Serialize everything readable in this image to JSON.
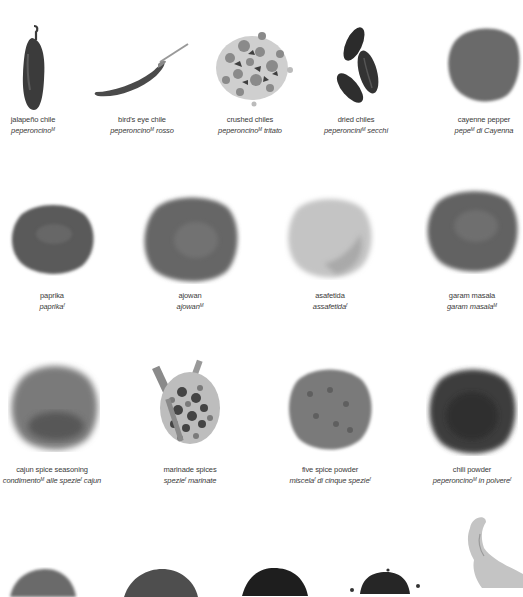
{
  "rows": [
    {
      "items": [
        {
          "id": "jalapeno",
          "en": "jalapeño chile",
          "it_parts": [
            {
              "t": "peperoncino",
              "g": "M"
            }
          ],
          "cx": 33,
          "label_y": 113,
          "art": "jalapeno-icon",
          "tone": "#3b3b3b"
        },
        {
          "id": "birds-eye",
          "en": "bird's eye chile",
          "it_parts": [
            {
              "t": "peperoncino",
              "g": "M"
            },
            {
              "t": " rosso"
            }
          ],
          "cx": 142,
          "label_y": 113,
          "art": "birds-eye-chile-icon",
          "tone": "#555555"
        },
        {
          "id": "crushed",
          "en": "crushed chiles",
          "it_parts": [
            {
              "t": "peperoncino",
              "g": "M"
            },
            {
              "t": " tritato"
            }
          ],
          "cx": 250,
          "label_y": 113,
          "art": "crushed-chiles-icon",
          "tone": "#8a8a8a"
        },
        {
          "id": "dried",
          "en": "dried chiles",
          "it_parts": [
            {
              "t": "peperoncini",
              "g": "M"
            },
            {
              "t": " secchi"
            }
          ],
          "cx": 356,
          "label_y": 113,
          "art": "dried-chiles-icon",
          "tone": "#2e2e2e"
        },
        {
          "id": "cayenne",
          "en": "cayenne pepper",
          "it_parts": [
            {
              "t": "pepe",
              "g": "M"
            },
            {
              "t": " di Cayenna"
            }
          ],
          "cx": 483,
          "label_y": 113,
          "art": "cayenne-powder-icon",
          "tone": "#6a6a6a"
        }
      ]
    },
    {
      "items": [
        {
          "id": "paprika",
          "en": "paprika",
          "it_parts": [
            {
              "t": "paprika",
              "g": "f"
            }
          ],
          "cx": 52,
          "label_y": 289,
          "art": "paprika-powder-icon",
          "tone": "#5e5e5e"
        },
        {
          "id": "ajowan",
          "en": "ajowan",
          "it_parts": [
            {
              "t": "ajowan",
              "g": "M"
            }
          ],
          "cx": 190,
          "label_y": 289,
          "art": "ajowan-powder-icon",
          "tone": "#6d6d6d"
        },
        {
          "id": "asafetida",
          "en": "asafetida",
          "it_parts": [
            {
              "t": "assafetida",
              "g": "f"
            }
          ],
          "cx": 330,
          "label_y": 289,
          "art": "asafetida-powder-icon",
          "tone": "#b5b5b5"
        },
        {
          "id": "garam",
          "en": "garam masala",
          "it_parts": [
            {
              "t": "garam masala",
              "g": "M"
            }
          ],
          "cx": 472,
          "label_y": 289,
          "art": "garam-masala-powder-icon",
          "tone": "#6a6a6a"
        }
      ]
    },
    {
      "items": [
        {
          "id": "cajun",
          "en": "cajun spice seasoning",
          "it_parts": [
            {
              "t": "condimento",
              "g": "M"
            },
            {
              "t": " alle spezie",
              "g": "f"
            },
            {
              "t": " cajun"
            }
          ],
          "cx": 52,
          "label_y": 463,
          "art": "cajun-seasoning-icon",
          "tone": "#6f6f6f"
        },
        {
          "id": "marinade",
          "en": "marinade spices",
          "it_parts": [
            {
              "t": "spezie",
              "g": "f"
            },
            {
              "t": " marinate"
            }
          ],
          "cx": 190,
          "label_y": 463,
          "art": "marinade-spices-icon",
          "tone": "#555555"
        },
        {
          "id": "fivespice",
          "en": "five spice powder",
          "it_parts": [
            {
              "t": "miscela",
              "g": "f"
            },
            {
              "t": " di cinque spezie",
              "g": "f"
            }
          ],
          "cx": 330,
          "label_y": 463,
          "art": "five-spice-powder-icon",
          "tone": "#7a7a7a"
        },
        {
          "id": "chili",
          "en": "chili powder",
          "it_parts": [
            {
              "t": "peperoncino",
              "g": "M"
            },
            {
              "t": " in polvere",
              "g": "f"
            }
          ],
          "cx": 472,
          "label_y": 463,
          "art": "chili-powder-icon",
          "tone": "#3a3a3a"
        }
      ]
    }
  ],
  "bottom_row": [
    {
      "art": "spice-mound-icon",
      "cx": 42,
      "tone": "#6a6a6a"
    },
    {
      "art": "spice-mound-icon",
      "cx": 160,
      "tone": "#555555"
    },
    {
      "art": "spice-mound-icon",
      "cx": 275,
      "tone": "#222222"
    },
    {
      "art": "seeds-mound-icon",
      "cx": 385,
      "tone": "#2a2a2a"
    },
    {
      "art": "ginger-root-icon",
      "cx": 495,
      "tone": "#bdbdbd"
    }
  ]
}
